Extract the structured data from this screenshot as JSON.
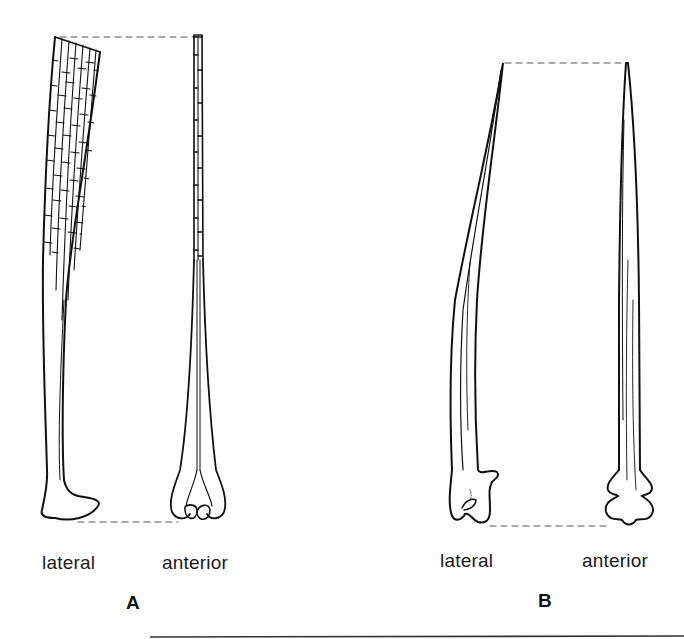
{
  "figure": {
    "panels": [
      {
        "id": "A",
        "label": "A",
        "views": [
          {
            "name": "lateral",
            "label": "lateral"
          },
          {
            "name": "anterior",
            "label": "anterior"
          }
        ]
      },
      {
        "id": "B",
        "label": "B",
        "views": [
          {
            "name": "lateral",
            "label": "lateral"
          },
          {
            "name": "anterior",
            "label": "anterior"
          }
        ]
      }
    ],
    "colors": {
      "line": "#111111",
      "dashed_guide": "#555555",
      "background": "#ffffff"
    }
  }
}
